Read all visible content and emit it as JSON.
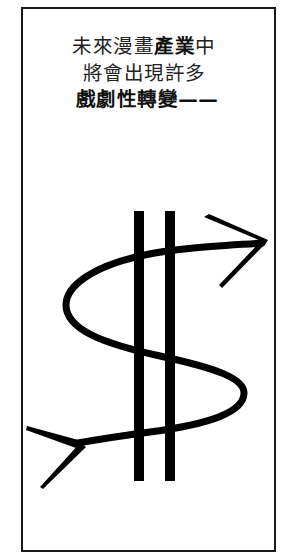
{
  "caption": {
    "line1_a": "未來漫畫",
    "line1_bold": "產業",
    "line1_b": "中",
    "line2": "將會出現許多",
    "line3": "戲劇性轉變——"
  },
  "illustration": {
    "subject": "dollar-sign-arrow-icon",
    "description": "Dollar sign drawn as an S-shaped arrow with two vertical bars",
    "stroke_color": "#000000"
  },
  "colors": {
    "background": "#ffffff",
    "border": "#1a1a1a",
    "text": "#222222"
  }
}
